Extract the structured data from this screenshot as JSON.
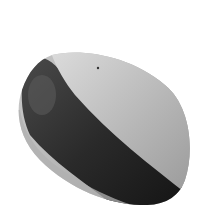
{
  "image": {
    "subject": "seed",
    "description": "Grayscale photograph of an oval seed or pebble, light on the upper right and dark on the lower left, on a white background",
    "colors": {
      "background": "#ffffff",
      "light_face": "#b8b8b8",
      "highlight": "#dcdcdc",
      "dark_band": "#1e1e1e",
      "mottled": "#4a4a4a",
      "rim": "#c8c8c8"
    }
  }
}
